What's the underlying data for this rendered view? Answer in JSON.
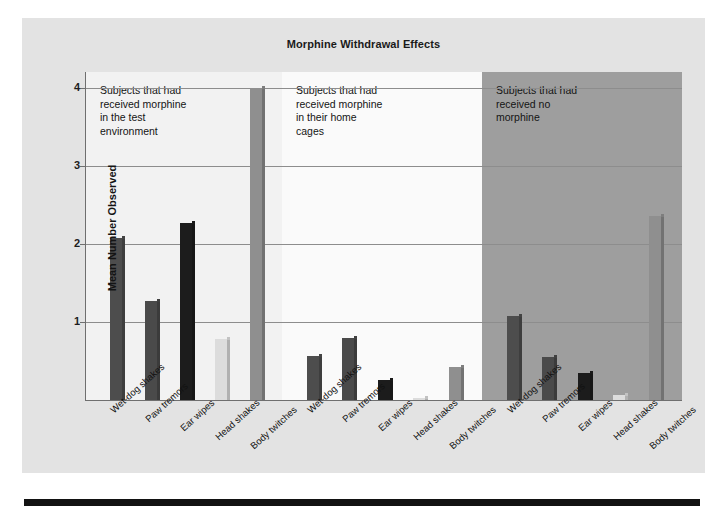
{
  "figure": {
    "title": "Morphine Withdrawal Effects",
    "ylabel": "Mean Number Observed"
  },
  "chart_data": {
    "type": "bar",
    "title": "Morphine Withdrawal Effects",
    "xlabel": "",
    "ylabel": "Mean Number Observed",
    "ylim": [
      0,
      4.2
    ],
    "yticks": [
      1,
      2,
      3,
      4
    ],
    "grid": true,
    "legend": "none",
    "categories": [
      "Wet-dog shakes",
      "Paw tremors",
      "Ear wipes",
      "Head shakes",
      "Body twitches"
    ],
    "panels": [
      {
        "name": "test-environment",
        "note": "Subjects that had\nreceived morphine\nin the test\nenvironment",
        "background": "#f2f2f2",
        "values": [
          2.08,
          1.27,
          2.27,
          0.78,
          4.0
        ]
      },
      {
        "name": "home-cages",
        "note": "Subjects that had\nreceived morphine\nin their home\ncages",
        "background": "#fafafa",
        "values": [
          0.57,
          0.8,
          0.26,
          0.03,
          0.42
        ]
      },
      {
        "name": "no-morphine",
        "note": "Subjects that had\nreceived no\nmorphine",
        "background": "#9e9e9e",
        "values": [
          1.07,
          0.55,
          0.35,
          0.07,
          2.35
        ]
      }
    ],
    "bar_colors": [
      "#4d4d4d",
      "#4a4a4a",
      "#1c1c1c",
      "#dcdcdc",
      "#8f8f8f"
    ]
  }
}
